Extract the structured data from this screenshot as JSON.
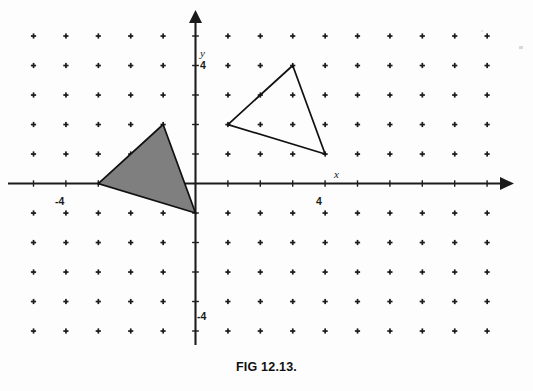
{
  "figure": {
    "caption": "FIG 12.13.",
    "background_color": "#fdfdfd",
    "ink_color": "#111111"
  },
  "axes": {
    "x_axis_label": "x",
    "y_axis_label": "y",
    "x_tick_label_positive": "4",
    "x_tick_label_negative": "-4",
    "y_tick_label_positive": "4",
    "y_tick_label_negative": "-4",
    "x_range": [
      -5,
      9
    ],
    "y_range": [
      -5,
      5
    ],
    "tick_interval": 1,
    "labeled_ticks_x": [
      -4,
      4
    ],
    "labeled_ticks_y": [
      -4,
      4
    ],
    "arrowheads": [
      "x-positive",
      "y-positive"
    ]
  },
  "chart_data": {
    "type": "scatter",
    "title": "FIG 12.13.",
    "xlabel": "x",
    "ylabel": "y",
    "xlim": [
      -5,
      9
    ],
    "ylim": [
      -5,
      5
    ],
    "grid": "lattice-of-dots",
    "grid_marker": "plus",
    "annotations": [],
    "series": [
      {
        "name": "image-triangle",
        "kind": "polygon",
        "fill": "none",
        "stroke": "#111111",
        "vertices": [
          {
            "x": 3,
            "y": 4
          },
          {
            "x": 1,
            "y": 2
          },
          {
            "x": 4,
            "y": 1
          }
        ]
      },
      {
        "name": "shaded-triangle",
        "kind": "polygon",
        "fill": "#7f7f7f",
        "stroke": "#111111",
        "vertices": [
          {
            "x": -1,
            "y": 2
          },
          {
            "x": -3,
            "y": 0
          },
          {
            "x": 0,
            "y": -1
          }
        ]
      }
    ],
    "lattice_points_x": [
      -5,
      -4,
      -3,
      -2,
      -1,
      0,
      1,
      2,
      3,
      4,
      5,
      6,
      7,
      8,
      9
    ],
    "lattice_points_y": [
      5,
      4,
      3,
      2,
      1,
      0,
      -1,
      -2,
      -3,
      -4,
      -5
    ]
  }
}
